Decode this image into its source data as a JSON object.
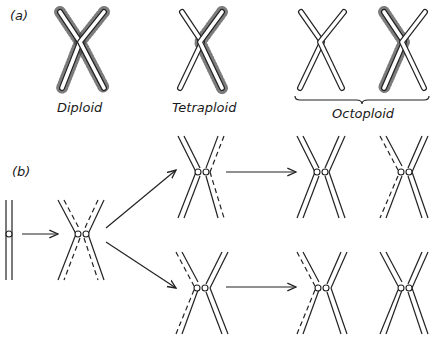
{
  "panel_a": {
    "label": "(a)",
    "groups": [
      {
        "name": "Diploid",
        "label": "Diploid",
        "chromosomes": 1,
        "dotted_arms": "both"
      },
      {
        "name": "Tetraploid",
        "label": "Tetraploid",
        "chromosomes": 1,
        "dotted_arms": "right"
      },
      {
        "name": "Octoploid",
        "label": "Octoploid",
        "chromosomes": 2,
        "dotted_arms": "one arm of second chromosome",
        "bracket": true
      }
    ]
  },
  "panel_b": {
    "label": "(b)",
    "stages": [
      "unreplicated chromosome",
      "replicated chromosome with labelled (dashed) strands",
      "two daughter chromosomes after second replication",
      "four granddaughter chromosomes after third replication"
    ]
  },
  "colors": {
    "line": "#222222",
    "background": "#ffffff",
    "stipple": "#333333"
  }
}
